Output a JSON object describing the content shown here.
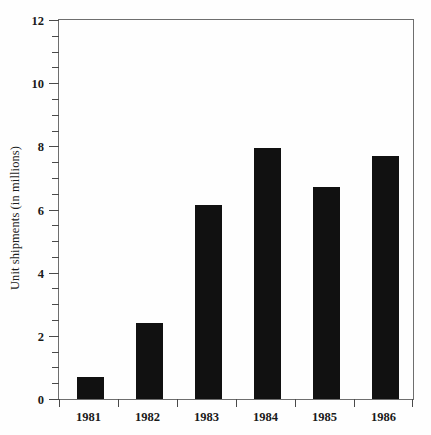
{
  "chart_data": {
    "type": "bar",
    "title": "",
    "subtitle": "",
    "xlabel": "",
    "ylabel": "Unit shipments (in millions)",
    "categories": [
      "1981",
      "1982",
      "1983",
      "1984",
      "1985",
      "1986"
    ],
    "values": [
      0.7,
      2.4,
      6.15,
      7.95,
      6.7,
      7.7
    ],
    "ylim": [
      0,
      12
    ],
    "xlim_ticks": 7,
    "y_major_step": 2,
    "y_minor_step": 0.5,
    "y_tick_labels": [
      "0",
      "2",
      "4",
      "6",
      "8",
      "10",
      "12"
    ],
    "grid": false,
    "legend": null,
    "legend_position": "none",
    "bar_color": "#111111",
    "axis_color": "#6e6e6e",
    "background_color": "#fefefe"
  },
  "axis": {
    "y_title": "Unit shipments (in millions)"
  }
}
